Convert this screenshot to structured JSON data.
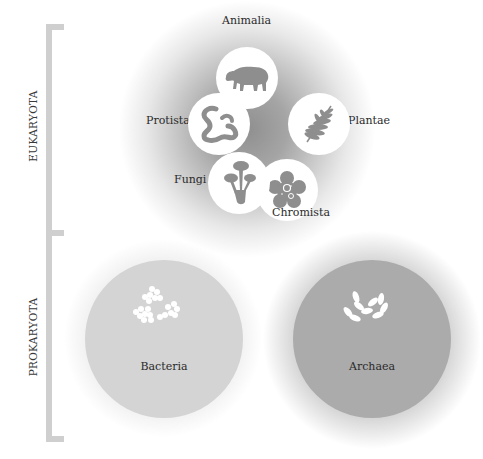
{
  "groups": {
    "eukaryota": {
      "label": "EUKARYOTA"
    },
    "prokaryota": {
      "label": "PROKARYOTA"
    }
  },
  "kingdoms": {
    "animalia": {
      "label": "Animalia",
      "icon": "tapir-icon"
    },
    "plantae": {
      "label": "Plantae",
      "icon": "fern-leaf-icon"
    },
    "chromista": {
      "label": "Chromista",
      "icon": "flower-cell-icon"
    },
    "fungi": {
      "label": "Fungi",
      "icon": "mushroom-icon"
    },
    "protista": {
      "label": "Protista",
      "icon": "squiggle-icon"
    }
  },
  "domains": {
    "bacteria": {
      "label": "Bacteria",
      "icon": "cocci-clusters-icon"
    },
    "archaea": {
      "label": "Archaea",
      "icon": "rod-cells-icon"
    }
  },
  "colors": {
    "bracket": "#cfcfcf",
    "icon_fill": "#8e8e8e",
    "bacteria_circle": "#d4d4d4",
    "archaea_circle": "#ababab",
    "eukaryota_center": "#9a9a9a"
  }
}
